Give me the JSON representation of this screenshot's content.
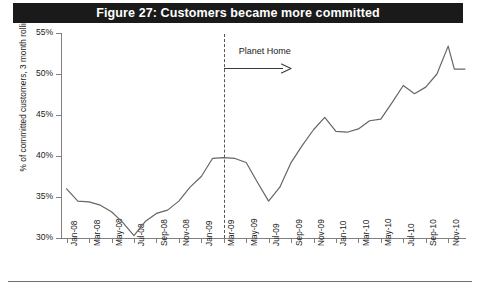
{
  "figure": {
    "title": "Figure 27: Customers became more committed",
    "title_bar_color": "#1a1a1a",
    "title_text_color": "#ffffff"
  },
  "chart_data": {
    "type": "line",
    "title": "Figure 27: Customers became more committed",
    "xlabel": "",
    "ylabel": "% of committed customers, 3 month rolling",
    "ylim": [
      30,
      55
    ],
    "ytick_labels": [
      "30%",
      "35%",
      "40%",
      "45%",
      "50%",
      "55%"
    ],
    "yticks": [
      30,
      35,
      40,
      45,
      50,
      55
    ],
    "grid": false,
    "legend": false,
    "line_color": "#666666",
    "x_tick_labels": [
      "Jan-08",
      "Mar-08",
      "May-08",
      "Jul-08",
      "Sep-08",
      "Nov-08",
      "Jan-09",
      "Mar-09",
      "May-09",
      "Jul-09",
      "Sep-09",
      "Nov-09",
      "Jan-10",
      "Mar-10",
      "May-10",
      "Jul-10",
      "Sep-10",
      "Nov-10"
    ],
    "x": [
      "Jan-08",
      "Feb-08",
      "Mar-08",
      "Apr-08",
      "May-08",
      "Jun-08",
      "Jul-08",
      "Aug-08",
      "Sep-08",
      "Oct-08",
      "Nov-08",
      "Dec-08",
      "Jan-09",
      "Feb-09",
      "Mar-09",
      "Apr-09",
      "May-09",
      "Jun-09",
      "Jul-09",
      "Aug-09",
      "Sep-09",
      "Oct-09",
      "Nov-09",
      "Dec-09",
      "Jan-10",
      "Feb-10",
      "Mar-10",
      "Apr-10",
      "May-10",
      "Jun-10",
      "Jul-10",
      "Aug-10",
      "Sep-10",
      "Oct-10",
      "Nov-10"
    ],
    "values": [
      36.0,
      34.5,
      34.4,
      34.0,
      33.2,
      31.9,
      30.3,
      32.0,
      33.0,
      33.4,
      34.5,
      36.2,
      37.5,
      39.7,
      39.8,
      39.7,
      39.2,
      36.8,
      34.5,
      36.2,
      39.2,
      41.3,
      43.2,
      44.7,
      43.0,
      42.9,
      43.3,
      44.3,
      44.5,
      46.5,
      48.6,
      47.6,
      48.4,
      50.0,
      53.4
    ],
    "tail_value": 50.6,
    "series_name": "% of committed customers, 3 month rolling",
    "annotations": [
      {
        "name": "planet-home",
        "label": "Planet Home",
        "marker_type": "vertical-dashed-line",
        "marker_x": "Mar-09",
        "arrow_direction": "right",
        "arrow_from": "Mar-09",
        "arrow_to": "Sep-09"
      }
    ]
  }
}
